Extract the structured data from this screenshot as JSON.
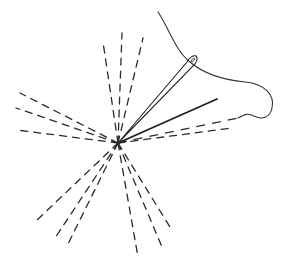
{
  "diagram": {
    "center": [
      118,
      143
    ],
    "colors": {
      "stroke": "#2a2a2a",
      "background": "#ffffff"
    },
    "elements": {
      "rays_upper": [
        [
          103,
          42
        ],
        [
          122,
          33
        ],
        [
          143,
          38
        ]
      ],
      "rays_left": [
        [
          20,
          93
        ],
        [
          16,
          108
        ],
        [
          17,
          130
        ]
      ],
      "rays_lower_left": [
        [
          36,
          221
        ],
        [
          55,
          238
        ],
        [
          67,
          246
        ]
      ],
      "rays_lower_right": [
        [
          170,
          227
        ],
        [
          162,
          247
        ],
        [
          138,
          257
        ]
      ],
      "ray_right_dashed": [
        [
          232,
          128
        ]
      ],
      "solid_line_end": [
        217,
        99
      ],
      "needle_eye": [
        193,
        60
      ],
      "thread_path": "M158,12 C170,30 175,50 190,62 C205,75 225,80 245,82 C265,84 275,95 272,108 C270,118 262,120 254,116 C248,113 245,114 238,118"
    }
  }
}
